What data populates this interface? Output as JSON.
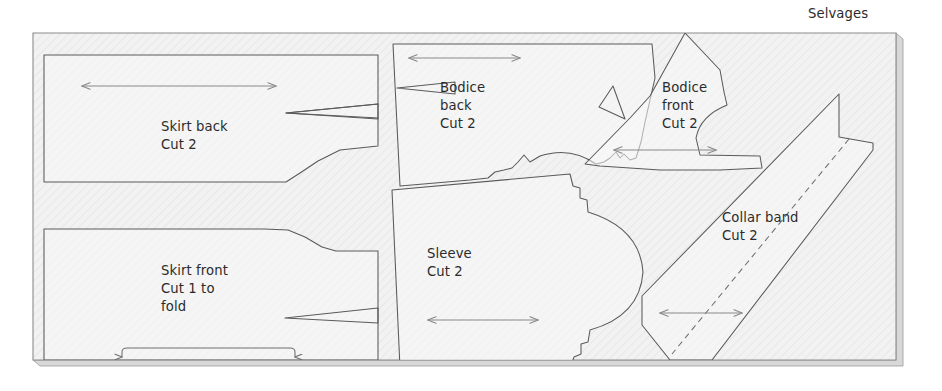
{
  "diagram": {
    "kind": "sewing-pattern-cutting-layout",
    "selvage_label": "Selvages",
    "fabric": {
      "fill_color": "#f2f2f2",
      "edge_color": "#8c8c8c",
      "shadow_color": "#d8d8d8"
    },
    "ink": {
      "text_color": "#2b2b2b",
      "piece_outline_color": "#5a5a5a",
      "grainline_color": "#8a8a8a",
      "foldline_color": "#6f6f6f"
    }
  },
  "pieces": [
    {
      "id": "skirt-back",
      "name": "Skirt back",
      "label_lines": [
        "Skirt back",
        "Cut 2"
      ],
      "cut_instruction": "Cut 2",
      "has_grainline": true,
      "has_dart": true,
      "has_fold_bracket": false
    },
    {
      "id": "skirt-front",
      "name": "Skirt front",
      "label_lines": [
        "Skirt front",
        "Cut 1 to",
        "fold"
      ],
      "cut_instruction": "Cut 1 to fold",
      "has_grainline": false,
      "has_dart": true,
      "has_fold_bracket": true
    },
    {
      "id": "bodice-back",
      "name": "Bodice back",
      "label_lines": [
        "Bodice",
        "back",
        "Cut 2"
      ],
      "cut_instruction": "Cut 2",
      "has_grainline": true,
      "has_dart": true,
      "has_fold_bracket": false
    },
    {
      "id": "bodice-front",
      "name": "Bodice front",
      "label_lines": [
        "Bodice",
        "front",
        "Cut 2"
      ],
      "cut_instruction": "Cut 2",
      "has_grainline": true,
      "has_dart": true,
      "has_fold_bracket": false
    },
    {
      "id": "sleeve",
      "name": "Sleeve",
      "label_lines": [
        "Sleeve",
        "Cut 2"
      ],
      "cut_instruction": "Cut 2",
      "has_grainline": true,
      "has_dart": false,
      "has_fold_bracket": false
    },
    {
      "id": "collar-band",
      "name": "Collar band",
      "label_lines": [
        "Collar band",
        "Cut 2"
      ],
      "cut_instruction": "Cut 2",
      "has_grainline": true,
      "has_dart": false,
      "has_fold_bracket": false,
      "has_center_foldline": true
    }
  ],
  "labels": {
    "selvages": "Selvages",
    "skirt_back_l1": "Skirt back",
    "skirt_back_l2": "Cut 2",
    "skirt_front_l1": "Skirt front",
    "skirt_front_l2": "Cut 1 to",
    "skirt_front_l3": "fold",
    "bodice_back_l1": "Bodice",
    "bodice_back_l2": "back",
    "bodice_back_l3": "Cut 2",
    "bodice_front_l1": "Bodice",
    "bodice_front_l2": "front",
    "bodice_front_l3": "Cut 2",
    "sleeve_l1": "Sleeve",
    "sleeve_l2": "Cut 2",
    "collar_band_l1": "Collar band",
    "collar_band_l2": "Cut 2"
  }
}
